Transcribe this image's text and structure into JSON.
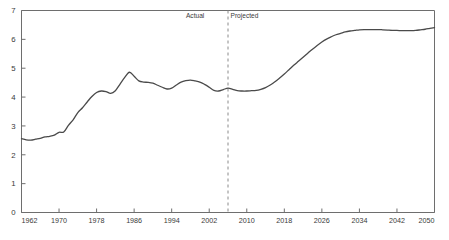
{
  "chart_data": {
    "type": "line",
    "title": "",
    "xlabel": "",
    "ylabel": "",
    "xlim": [
      1962,
      2050
    ],
    "ylim": [
      0,
      7
    ],
    "grid": false,
    "legend": "none",
    "xticks": [
      "1962",
      "1970",
      "1978",
      "1986",
      "1994",
      "2002",
      "2010",
      "2018",
      "2026",
      "2034",
      "2042",
      "2050"
    ],
    "xtick_values": [
      1962,
      1970,
      1978,
      1986,
      1994,
      2002,
      2010,
      2018,
      2026,
      2034,
      2042,
      2050
    ],
    "yticks": [
      "0",
      "1",
      "2",
      "3",
      "4",
      "5",
      "6",
      "7"
    ],
    "ytick_values": [
      0,
      1,
      2,
      3,
      4,
      5,
      6,
      7
    ],
    "annotations": [
      {
        "text": "Actual",
        "x": 1999.0,
        "y": 6.75,
        "name": "actual-label"
      },
      {
        "text": "Projected",
        "x": 2009.5,
        "y": 6.75,
        "name": "projected-label"
      }
    ],
    "divider": {
      "x": 2006,
      "style": "dashed",
      "color": "#8a8a8a",
      "label_left": "Actual",
      "label_right": "Projected"
    },
    "series": [
      {
        "name": "value",
        "color": "#4a4a4a",
        "x": [
          1962,
          1963,
          1964,
          1965,
          1966,
          1967,
          1968,
          1969,
          1970,
          1971,
          1972,
          1973,
          1974,
          1975,
          1976,
          1977,
          1978,
          1979,
          1980,
          1981,
          1982,
          1983,
          1984,
          1985,
          1986,
          1987,
          1988,
          1989,
          1990,
          1991,
          1992,
          1993,
          1994,
          1995,
          1996,
          1997,
          1998,
          1999,
          2000,
          2001,
          2002,
          2003,
          2004,
          2005,
          2006,
          2007,
          2008,
          2009,
          2010,
          2011,
          2012,
          2013,
          2014,
          2015,
          2016,
          2017,
          2018,
          2019,
          2020,
          2021,
          2022,
          2023,
          2024,
          2025,
          2026,
          2027,
          2028,
          2029,
          2030,
          2031,
          2032,
          2033,
          2034,
          2035,
          2036,
          2037,
          2038,
          2039,
          2040,
          2041,
          2042,
          2043,
          2044,
          2045,
          2046,
          2047,
          2048,
          2049,
          2050
        ],
        "y": [
          2.56,
          2.52,
          2.51,
          2.54,
          2.57,
          2.62,
          2.64,
          2.68,
          2.78,
          2.79,
          3.02,
          3.21,
          3.46,
          3.63,
          3.83,
          4.02,
          4.16,
          4.21,
          4.19,
          4.13,
          4.22,
          4.45,
          4.68,
          4.86,
          4.72,
          4.56,
          4.52,
          4.51,
          4.48,
          4.41,
          4.34,
          4.28,
          4.31,
          4.42,
          4.52,
          4.57,
          4.59,
          4.56,
          4.52,
          4.44,
          4.34,
          4.23,
          4.21,
          4.26,
          4.31,
          4.27,
          4.22,
          4.21,
          4.21,
          4.22,
          4.23,
          4.27,
          4.33,
          4.42,
          4.53,
          4.66,
          4.8,
          4.95,
          5.1,
          5.24,
          5.38,
          5.52,
          5.66,
          5.79,
          5.91,
          6.01,
          6.09,
          6.16,
          6.21,
          6.26,
          6.29,
          6.31,
          6.33,
          6.34,
          6.34,
          6.34,
          6.34,
          6.33,
          6.32,
          6.31,
          6.31,
          6.3,
          6.3,
          6.3,
          6.31,
          6.33,
          6.35,
          6.38,
          6.41
        ]
      }
    ]
  },
  "axes": {
    "frame_color": "#6e6e6e",
    "tick_color": "#6e6e6e"
  }
}
